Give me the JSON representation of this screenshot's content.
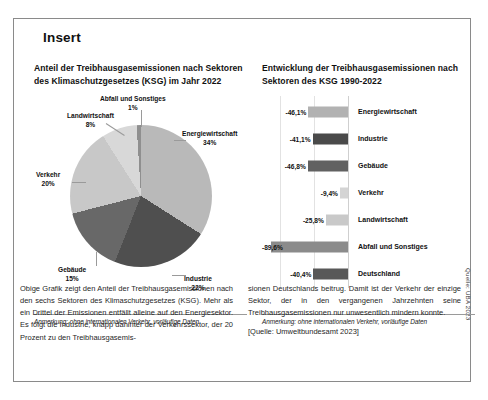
{
  "insert": {
    "legend": "Insert"
  },
  "left_panel": {
    "title": "Anteil der Treibhausgasemissionen nach Sektoren des Klimaschutzgesetzes (KSG) im Jahr 2022",
    "caption": "Anmerkung: ohne internationalen Verkehr, vorläufige Daten"
  },
  "right_panel": {
    "title": "Entwicklung der Treibhausgasemissionen nach Sektoren des KSG 1990-2022",
    "caption": "Anmerkung: ohne internationalen Verkehr, vorläufige Daten",
    "source": "Quelle: UBA 2023"
  },
  "body": {
    "left_paragraph": "Obige Grafik zeigt den Anteil der Treibhausgasemissionen nach den sechs Sektoren des Klimaschutzgesetzes (KSG). Mehr als ein Drittel der Emissionen entfällt alleine auf den Energiesektor. Es folgt die Industrie, knapp dahinter der Verkehrssektor, der 20 Prozent zu den Treibhausgasemis-",
    "right_paragraph": "sionen Deutschlands beitrug. Damit ist der Verkehr der einzige Sektor, der in den vergangenen Jahrzehnten seine Treibhausgasemissionen nur unwesentlich mindern konnte.",
    "right_source": "[Quelle: Umweltbundesamt 2023]"
  },
  "chart_data": [
    {
      "type": "pie",
      "title": "Anteil der Treibhausgasemissionen nach Sektoren des Klimaschutzgesetzes (KSG) im Jahr 2022",
      "unit": "%",
      "categories": [
        "Energiewirtschaft",
        "Industrie",
        "Gebäude",
        "Verkehr",
        "Landwirtschaft",
        "Abfall und Sonstiges"
      ],
      "values": [
        34,
        22,
        15,
        20,
        8,
        1
      ],
      "labels": [
        "34%",
        "22%",
        "15%",
        "20%",
        "8%",
        "1%"
      ],
      "colors": [
        "#b9b9b9",
        "#4f4f4f",
        "#686868",
        "#c8c8c8",
        "#d8d8d8",
        "#8f8f8f"
      ],
      "legend": "none",
      "note": "Anmerkung: ohne internationalen Verkehr, vorläufige Daten"
    },
    {
      "type": "bar",
      "orientation": "horizontal",
      "title": "Entwicklung der Treibhausgasemissionen nach Sektoren des KSG 1990-2022",
      "xlabel": "",
      "ylabel": "",
      "unit": "%",
      "grid": true,
      "xlim": [
        -100,
        0
      ],
      "categories": [
        "Energiewirtschaft",
        "Industrie",
        "Gebäude",
        "Verkehr",
        "Landwirtschaft",
        "Abfall und Sonstiges",
        "Deutschland"
      ],
      "values": [
        -46.1,
        -41.1,
        -46.8,
        -9.4,
        -25.8,
        -89.6,
        -40.4
      ],
      "labels": [
        "-46,1%",
        "-41,1%",
        "-46,8%",
        "-9,4%",
        "-25,8%",
        "-89,6%",
        "-40,4%"
      ],
      "colors": [
        "#b2b2b2",
        "#4a4a4a",
        "#616161",
        "#d4d4d4",
        "#c9c9c9",
        "#8b8b8b",
        "#585858"
      ],
      "source": "Quelle: UBA 2023",
      "note": "Anmerkung: ohne internationalen Verkehr, vorläufige Daten"
    }
  ]
}
